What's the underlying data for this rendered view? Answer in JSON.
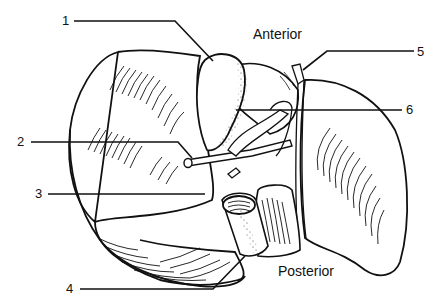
{
  "figure": {
    "orientation_labels": {
      "top": "Anterior",
      "bottom": "Posterior"
    },
    "callouts": [
      {
        "number": "1",
        "side": "left"
      },
      {
        "number": "2",
        "side": "left"
      },
      {
        "number": "3",
        "side": "left"
      },
      {
        "number": "4",
        "side": "left"
      },
      {
        "number": "5",
        "side": "right"
      },
      {
        "number": "6",
        "side": "right"
      }
    ],
    "colors": {
      "ink": "#111111",
      "background": "#ffffff"
    }
  }
}
